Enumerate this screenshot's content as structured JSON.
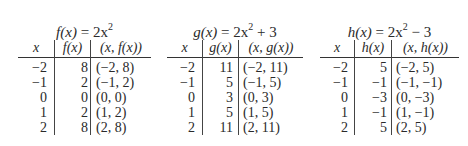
{
  "tables": [
    {
      "title_fn": "f(x)",
      "title_expr": "= 2x",
      "title_exp": "2",
      "title_tail": "",
      "headers": [
        "x",
        "f(x)",
        "(x, f(x))"
      ],
      "rows": [
        [
          "−2",
          "8",
          "(−2, 8)"
        ],
        [
          "−1",
          "2",
          "(−1, 2)"
        ],
        [
          "0",
          "0",
          "(0, 0)"
        ],
        [
          "1",
          "2",
          "(1, 2)"
        ],
        [
          "2",
          "8",
          "(2, 8)"
        ]
      ]
    },
    {
      "title_fn": "g(x)",
      "title_expr": "= 2x",
      "title_exp": "2",
      "title_tail": " + 3",
      "headers": [
        "x",
        "g(x)",
        "(x, g(x))"
      ],
      "rows": [
        [
          "−2",
          "11",
          "(−2, 11)"
        ],
        [
          "−1",
          "5",
          "(−1, 5)"
        ],
        [
          "0",
          "3",
          "(0, 3)"
        ],
        [
          "1",
          "5",
          "(1, 5)"
        ],
        [
          "2",
          "11",
          "(2, 11)"
        ]
      ]
    },
    {
      "title_fn": "h(x)",
      "title_expr": "= 2x",
      "title_exp": "2",
      "title_tail": " − 3",
      "headers": [
        "x",
        "h(x)",
        "(x, h(x))"
      ],
      "rows": [
        [
          "−2",
          "5",
          "(−2, 5)"
        ],
        [
          "−1",
          "−1",
          "(−1, −1)"
        ],
        [
          "0",
          "−3",
          "(0, −3)"
        ],
        [
          "1",
          "−1",
          "(1, −1)"
        ],
        [
          "2",
          "5",
          "(2, 5)"
        ]
      ]
    }
  ]
}
